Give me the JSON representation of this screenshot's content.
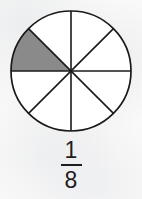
{
  "figure": {
    "type": "fraction-circle-diagram",
    "background_color": "#fafafa",
    "circle": {
      "center_x": 71,
      "center_y": 71,
      "radius": 60,
      "stroke_color": "#1a1a1a",
      "stroke_width": 1.6,
      "fill_color": "#ffffff",
      "total_sectors": 8,
      "sector_angle_degrees": 45,
      "shaded_sectors": 1,
      "shaded_fill_color": "#8a8a8a",
      "shaded_sector_start_degrees": 135,
      "shaded_sector_end_degrees": 180,
      "divider_count": 4,
      "divider_angles_degrees": [
        0,
        45,
        90,
        135
      ]
    }
  },
  "label": {
    "fraction_text": "1/8",
    "numerator": "1",
    "denominator": "8",
    "bar_color": "#1d1d1d",
    "text_color": "#1d1d1d"
  },
  "chart_data": {
    "type": "pie",
    "title": "",
    "categories": [
      "shaded",
      "unshaded"
    ],
    "values": [
      1,
      7
    ],
    "slice_count": 8,
    "each_slice_value": 0.125,
    "shaded_fraction": "1/8",
    "colors": [
      "#8a8a8a",
      "#ffffff"
    ],
    "legend": "none",
    "grid": false
  }
}
